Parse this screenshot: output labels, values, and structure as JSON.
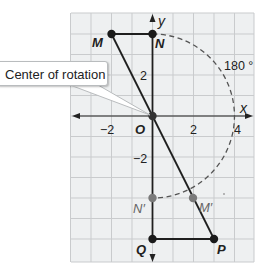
{
  "diagram": {
    "type": "coordinate-plane-rotation",
    "callout": {
      "label": "Center of rotation",
      "points_to": "O"
    },
    "angle_label": "180 °",
    "axes": {
      "x_label": "x",
      "y_label": "y",
      "origin_label": "O",
      "x_ticks": [
        {
          "value": -2,
          "label": "−2"
        },
        {
          "value": 2,
          "label": "2"
        },
        {
          "value": 4,
          "label": "4"
        }
      ],
      "y_ticks": [
        {
          "value": 2,
          "label": "2"
        },
        {
          "value": -2,
          "label": "−2"
        }
      ]
    },
    "points": {
      "M": {
        "label": "M",
        "x": -2,
        "y": 4,
        "color": "#1a1a1a"
      },
      "N": {
        "label": "N",
        "x": 0,
        "y": 4,
        "color": "#1a1a1a"
      },
      "O": {
        "label": "O",
        "x": 0,
        "y": 0,
        "color": "#333333"
      },
      "P": {
        "label": "P",
        "x": 3,
        "y": -6,
        "color": "#1a1a1a"
      },
      "Q": {
        "label": "Q",
        "x": 0,
        "y": -6,
        "color": "#1a1a1a"
      },
      "N_prime": {
        "label": "N′",
        "x": 0,
        "y": -4,
        "color": "#7a7a7a"
      },
      "M_prime": {
        "label": "M′",
        "x": 2,
        "y": -4,
        "color": "#7a7a7a"
      }
    },
    "segments": [
      "M-N",
      "M-P",
      "N-Q",
      "Q-P"
    ],
    "arc": {
      "from": "N",
      "to": "N′",
      "center": "O",
      "radius": 4,
      "style": "dashed"
    },
    "colors": {
      "grid_line": "#c9cbcd",
      "grid_bg": "#eef0f1",
      "axis": "#222222",
      "segment": "#1f1f1f",
      "image_point": "#7a7a7a",
      "arc": "#555555"
    }
  }
}
